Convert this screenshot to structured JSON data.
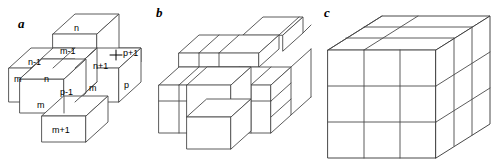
{
  "figure": {
    "width": 497,
    "height": 164,
    "background": "#ffffff",
    "line_color": "#4a4a4a",
    "text_color": "#000000"
  },
  "panels": [
    {
      "id": "a",
      "letter": "a",
      "caption": "",
      "description": "Three-dimensional cross (plus-shape) of seven unit cubes with neighbour index labels",
      "cube_count": 7
    },
    {
      "id": "b",
      "letter": "b",
      "caption": "",
      "description": "Larger cluster of unit cubes forming a stepped three-dimensional cross arrangement",
      "cube_count": 19
    },
    {
      "id": "c",
      "letter": "c",
      "caption": "",
      "description": "Full three by three by three block of unit cubes",
      "cube_count": 27
    }
  ],
  "panel_a_labels": [
    {
      "id": "top-n",
      "text": "n",
      "x": 74,
      "y": 28
    },
    {
      "id": "top-m-minus",
      "text": "m-1",
      "x": 62,
      "y": 52
    },
    {
      "id": "left-n-minus",
      "text": "n-1",
      "x": 32,
      "y": 64
    },
    {
      "id": "left-m",
      "text": "m",
      "x": 16,
      "y": 79
    },
    {
      "id": "center-n",
      "text": "n",
      "x": 45,
      "y": 79
    },
    {
      "id": "front-m",
      "text": "m",
      "x": 38,
      "y": 105
    },
    {
      "id": "center-p-minus",
      "text": "p-1",
      "x": 61,
      "y": 93
    },
    {
      "id": "right-n-plus",
      "text": "n+1",
      "x": 96,
      "y": 67
    },
    {
      "id": "right-m",
      "text": "m",
      "x": 91,
      "y": 88
    },
    {
      "id": "right-p",
      "text": "p",
      "x": 125,
      "y": 84
    },
    {
      "id": "back-p-plus",
      "text": "p+1",
      "x": 124,
      "y": 50
    },
    {
      "id": "bottom-m-plus",
      "text": "m+1",
      "x": 53,
      "y": 130
    }
  ]
}
